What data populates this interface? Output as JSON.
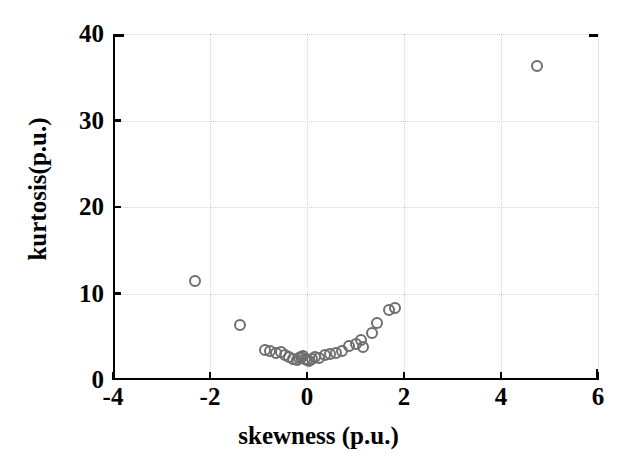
{
  "figure": {
    "background_color": "#ffffff",
    "marker_color": "#6e6e6e",
    "axis_color": "#000000",
    "grid_color": "#d2d2d2"
  },
  "chart_data": {
    "type": "scatter",
    "title": "",
    "xlabel": "skewness (p.u.)",
    "ylabel": "kurtosis(p.u.)",
    "xlim": [
      -4,
      6
    ],
    "ylim": [
      0,
      40
    ],
    "xticks": [
      -4,
      -2,
      0,
      2,
      4,
      6
    ],
    "yticks": [
      0,
      10,
      20,
      30,
      40
    ],
    "xtick_labels": [
      "-4",
      "-2",
      "0",
      "2",
      "4",
      "6"
    ],
    "ytick_labels": [
      "0",
      "10",
      "20",
      "30",
      "40"
    ],
    "grid": true,
    "legend": null,
    "marker": "open-circle",
    "series": [
      {
        "name": "signals",
        "points": [
          [
            -2.31,
            11.45
          ],
          [
            -1.38,
            6.36
          ],
          [
            -0.87,
            3.47
          ],
          [
            -0.77,
            3.35
          ],
          [
            -0.64,
            3.12
          ],
          [
            -0.54,
            3.24
          ],
          [
            -0.46,
            2.89
          ],
          [
            -0.37,
            2.66
          ],
          [
            -0.29,
            2.43
          ],
          [
            -0.21,
            2.31
          ],
          [
            -0.16,
            2.54
          ],
          [
            -0.12,
            2.66
          ],
          [
            -0.08,
            2.78
          ],
          [
            -0.04,
            2.43
          ],
          [
            0.0,
            2.31
          ],
          [
            0.04,
            2.2
          ],
          [
            0.1,
            2.43
          ],
          [
            0.16,
            2.66
          ],
          [
            0.25,
            2.54
          ],
          [
            0.37,
            2.89
          ],
          [
            0.47,
            3.0
          ],
          [
            0.6,
            3.12
          ],
          [
            0.72,
            3.35
          ],
          [
            0.87,
            3.93
          ],
          [
            1.0,
            4.16
          ],
          [
            1.11,
            4.62
          ],
          [
            1.16,
            3.82
          ],
          [
            1.34,
            5.43
          ],
          [
            1.45,
            6.59
          ],
          [
            1.7,
            8.09
          ],
          [
            1.82,
            8.32
          ],
          [
            4.74,
            36.3
          ]
        ]
      }
    ]
  }
}
